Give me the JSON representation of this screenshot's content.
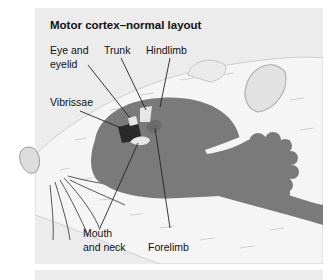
{
  "figure": {
    "title": "Motor cortex–normal layout",
    "labels": {
      "eye_and_eyelid_line1": "Eye and",
      "eye_and_eyelid_line2": "eyelid",
      "trunk": "Trunk",
      "hindlimb": "Hindlimb",
      "vibrissae": "Vibrissae",
      "mouth_and_neck_line1": "Mouth",
      "mouth_and_neck_line2": "and neck",
      "forelimb": "Forelimb"
    },
    "colors": {
      "panel_bg": "#ececec",
      "brain": "#7a7a7a",
      "fur": "#f4f4f4",
      "vibrissae_region": "#2a2a2a",
      "light_regions": "#e6e6e6"
    }
  }
}
